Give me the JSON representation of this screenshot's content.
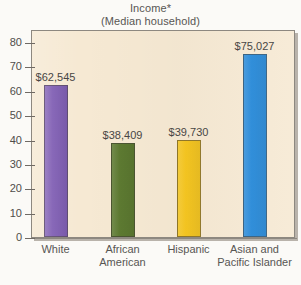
{
  "chart_data": {
    "type": "bar",
    "title": "Income*",
    "subtitle": "(Median household)",
    "xlabel": "",
    "ylabel": "",
    "ylim": [
      0,
      85
    ],
    "grid": false,
    "legend": "none",
    "yticks": [
      "0",
      "10",
      "20",
      "30",
      "40",
      "50",
      "60",
      "70",
      "80"
    ],
    "ytick_values": [
      0,
      10,
      20,
      30,
      40,
      50,
      60,
      70,
      80
    ],
    "categories": [
      "White",
      "African\nAmerican",
      "Hispanic",
      "Asian and\nPacific Islander"
    ],
    "values": [
      62.545,
      38.409,
      39.73,
      75.027
    ],
    "data_labels": [
      "$62,545",
      "$38,409",
      "$39,730",
      "$75,027"
    ],
    "bar_colors": [
      "#7a57b0",
      "#5d7a31",
      "#f6c61f",
      "#2287d8"
    ],
    "units_note": "values in thousands of dollars"
  },
  "colors": {
    "plot_background": "#f6e9d3",
    "page_background": "#fbfaf7",
    "axis": "#8d8880",
    "text": "#585653",
    "bar_purple": "#7a57b0",
    "bar_green": "#5d7a31",
    "bar_yellow": "#f6c61f",
    "bar_blue": "#2287d8"
  }
}
